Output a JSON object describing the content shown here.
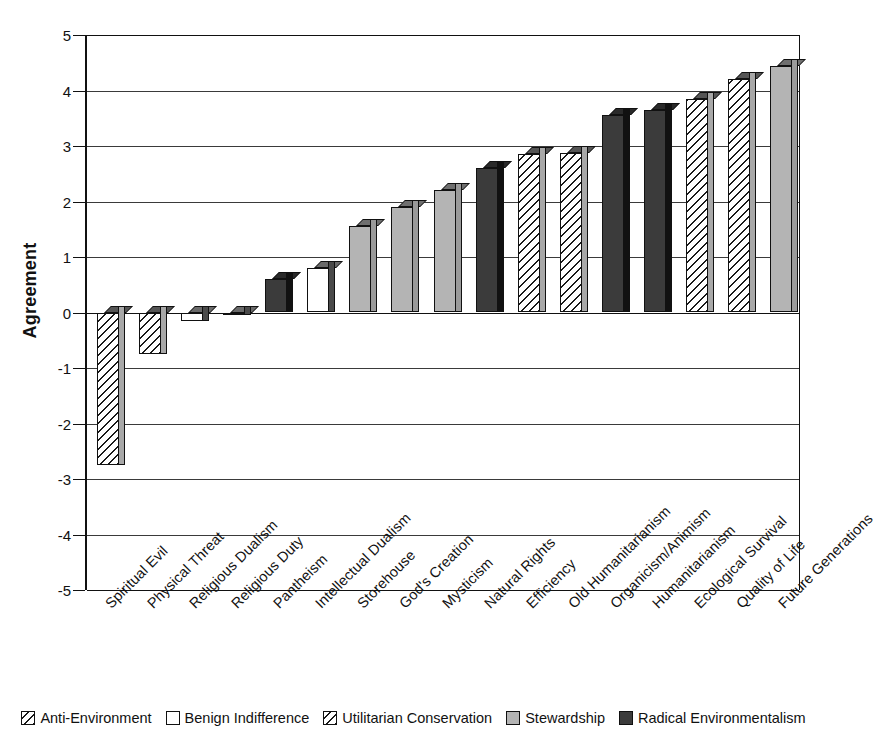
{
  "chart_data": {
    "type": "bar",
    "title": "",
    "xlabel": "",
    "ylabel": "Agreement",
    "ylim": [
      -5,
      5
    ],
    "ytick_labels": [
      "5",
      "4",
      "3",
      "2",
      "1",
      "0",
      "-1",
      "-2",
      "-3",
      "-4",
      "-5"
    ],
    "ytick_values": [
      5,
      4,
      3,
      2,
      1,
      0,
      -1,
      -2,
      -3,
      -4,
      -5
    ],
    "grid": true,
    "legend_position": "bottom",
    "categories": [
      "Spiritual Evil",
      "Physical Threat",
      "Religious Dualism",
      "Religious Duty",
      "Pantheism",
      "Intellectual Dualism",
      "Storehouse",
      "God's Creation",
      "Mysticism",
      "Natural Rights",
      "Efficiency",
      "Old Humanitarianism",
      "Organicism/Animism",
      "Humanitarianism",
      "Ecological Survival",
      "Quality of Life",
      "Future Generations"
    ],
    "values": [
      -2.75,
      -0.75,
      -0.15,
      -0.02,
      0.6,
      0.8,
      1.55,
      1.9,
      2.2,
      2.6,
      2.85,
      2.88,
      3.55,
      3.65,
      3.85,
      4.2,
      4.45
    ],
    "point_series": [
      "anti-environment",
      "anti-environment",
      "benign-indifference",
      "benign-indifference",
      "radical-environmentalism",
      "benign-indifference",
      "stewardship",
      "stewardship",
      "stewardship",
      "radical-environmentalism",
      "utilitarian-conservation",
      "utilitarian-conservation",
      "radical-environmentalism",
      "radical-environmentalism",
      "utilitarian-conservation",
      "utilitarian-conservation",
      "stewardship"
    ],
    "legend": [
      {
        "key": "anti-environment",
        "label": "Anti-Environment",
        "fill": "hatch",
        "color": "#ffffff"
      },
      {
        "key": "benign-indifference",
        "label": "Benign Indifference",
        "fill": "white",
        "color": "#ffffff"
      },
      {
        "key": "utilitarian-conservation",
        "label": "Utilitarian Conservation",
        "fill": "hatch",
        "color": "#ffffff"
      },
      {
        "key": "stewardship",
        "label": "Stewardship",
        "fill": "gray",
        "color": "#b4b4b4"
      },
      {
        "key": "radical-environmentalism",
        "label": "Radical Environmentalism",
        "fill": "dark",
        "color": "#3b3b3b"
      }
    ]
  }
}
